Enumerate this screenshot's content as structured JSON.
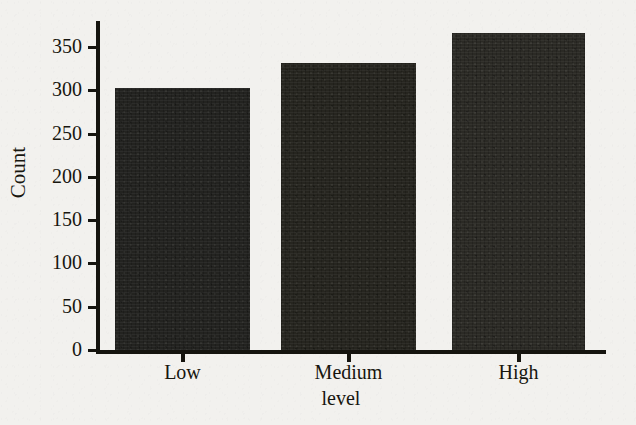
{
  "figure": {
    "background_color": "#f2f1ee",
    "ink_color": "#17160f"
  },
  "ghost_text": {
    "left_mid": "",
    "left_low": ""
  },
  "chart_data": {
    "type": "bar",
    "title": "",
    "xlabel": "level",
    "ylabel": "Count",
    "categories": [
      "Low",
      "Medium",
      "High"
    ],
    "values": [
      303,
      332,
      366
    ],
    "ylim": [
      0,
      380
    ],
    "yticks": [
      0,
      50,
      100,
      150,
      200,
      250,
      300,
      350
    ],
    "ytick_labels": [
      "0",
      "50",
      "100",
      "150",
      "200",
      "250",
      "300",
      "350"
    ],
    "grid": false,
    "legend": false,
    "bar_colors": [
      "#232320",
      "#26251f",
      "#2b2a25"
    ],
    "series": [
      {
        "name": "Count",
        "values": [
          303,
          332,
          366
        ]
      }
    ]
  }
}
